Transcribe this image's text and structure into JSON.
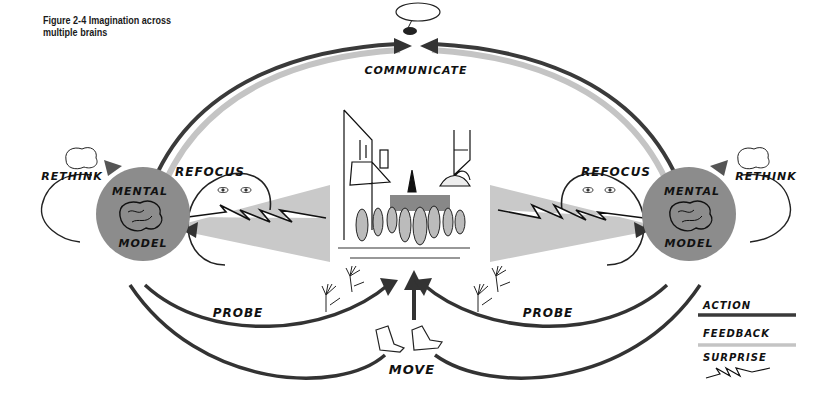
{
  "figure": {
    "caption_line1": "Figure 2-4  Imagination across",
    "caption_line2": "multiple brains"
  },
  "labels": {
    "communicate": "COMMUNICATE",
    "rethink_left": "RETHINK",
    "rethink_right": "RETHINK",
    "refocus_left": "REFOCUS",
    "refocus_right": "REFOCUS",
    "mental_left": "MENTAL",
    "model_left": "MODEL",
    "mental_right": "MENTAL",
    "model_right": "MODEL",
    "probe_left": "PROBE",
    "probe_right": "PROBE",
    "move": "MOVE"
  },
  "legend": {
    "items": [
      {
        "label": "ACTION",
        "style": "dark-line"
      },
      {
        "label": "FEEDBACK",
        "style": "light-line"
      },
      {
        "label": "SURPRISE",
        "style": "zigzag"
      }
    ]
  },
  "icons": {
    "speech_bubble": "speech-bubble-mouth-icon",
    "brain": "brain-icon",
    "eyes": "eyes-icon",
    "hands": "waving-hands-icon",
    "shoes": "sneakers-icon",
    "street_scene": "street-scene-illustration"
  },
  "colors": {
    "action": "#3a3a3a",
    "feedback": "#c4c4c4",
    "mental_model_circle": "#8c8c8c",
    "perception_wedge": "#c9c9c9",
    "ink": "#111111"
  }
}
